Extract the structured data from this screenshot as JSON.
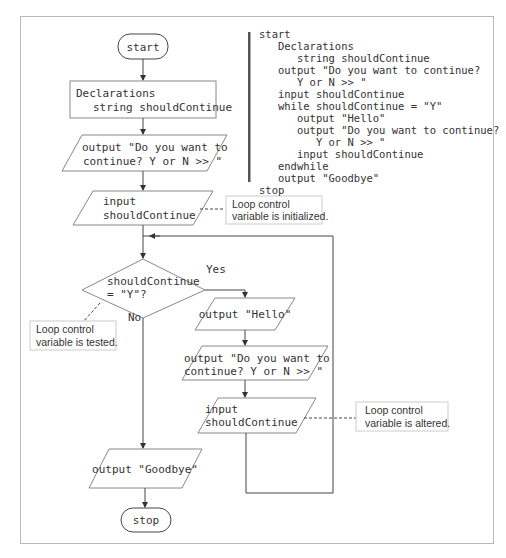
{
  "flowchart": {
    "start_label": "start",
    "declarations": {
      "line1": "Declarations",
      "line2": "string shouldContinue"
    },
    "prompt1": {
      "line1": "output \"Do you want to",
      "line2": "continue? Y or N >> \""
    },
    "input1": {
      "line1": "input",
      "line2": "shouldContinue"
    },
    "decision": {
      "line1": "shouldContinue",
      "line2": "= \"Y\"?",
      "yes_label": "Yes",
      "no_label": "No"
    },
    "output_hello": "output \"Hello\"",
    "prompt2": {
      "line1": "output \"Do you want to",
      "line2": "continue? Y or N >> \""
    },
    "input2": {
      "line1": "input",
      "line2": "shouldContinue"
    },
    "output_goodbye": "output \"Goodbye\"",
    "stop_label": "stop"
  },
  "callouts": {
    "initialized": {
      "line1": "Loop control",
      "line2": "variable is initialized."
    },
    "tested": {
      "line1": "Loop control",
      "line2": "variable is tested."
    },
    "altered": {
      "line1": "Loop control",
      "line2": "variable is altered."
    }
  },
  "pseudocode": {
    "lines": [
      "start",
      "   Declarations",
      "      string shouldContinue",
      "   output \"Do you want to continue?",
      "      Y or N >> \"",
      "   input shouldContinue",
      "   while shouldContinue = \"Y\"",
      "      output \"Hello\"",
      "      output \"Do you want to continue?",
      "         Y or N >> \"",
      "      input shouldContinue",
      "   endwhile",
      "   output \"Goodbye\"",
      "stop"
    ]
  }
}
